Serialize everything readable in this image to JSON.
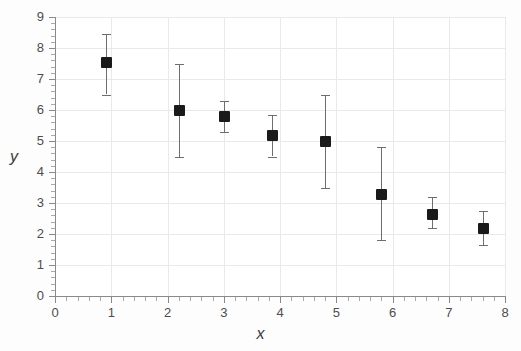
{
  "chart_data": {
    "type": "scatter",
    "title": "",
    "xlabel": "x",
    "ylabel": "y",
    "xlim": [
      0,
      8
    ],
    "ylim": [
      0,
      9
    ],
    "grid": true,
    "legend": null,
    "x_ticks": [
      "0",
      "1",
      "2",
      "3",
      "4",
      "5",
      "6",
      "7",
      "8"
    ],
    "x_tick_values": [
      0,
      1,
      2,
      3,
      4,
      5,
      6,
      7,
      8
    ],
    "y_ticks": [
      "0",
      "1",
      "2",
      "3",
      "4",
      "5",
      "6",
      "7",
      "8",
      "9"
    ],
    "y_tick_values": [
      0,
      1,
      2,
      3,
      4,
      5,
      6,
      7,
      8,
      9
    ],
    "minor_ticks": true,
    "marker_style": "filled-square",
    "marker_color": "#1a1a1a",
    "errorbar_color": "#6e6e6e",
    "gridline_color": "#e9e9e9",
    "axis_color": "#8a8a8a",
    "points": [
      {
        "x": 0.9,
        "y": 7.55,
        "yerr_low": 6.5,
        "yerr_high": 8.45
      },
      {
        "x": 2.2,
        "y": 6.0,
        "yerr_low": 4.5,
        "yerr_high": 7.5
      },
      {
        "x": 3.0,
        "y": 5.8,
        "yerr_low": 5.3,
        "yerr_high": 6.3
      },
      {
        "x": 3.85,
        "y": 5.2,
        "yerr_low": 4.5,
        "yerr_high": 5.85
      },
      {
        "x": 4.8,
        "y": 5.0,
        "yerr_low": 3.5,
        "yerr_high": 6.5
      },
      {
        "x": 5.8,
        "y": 3.3,
        "yerr_low": 1.8,
        "yerr_high": 4.8
      },
      {
        "x": 6.7,
        "y": 2.65,
        "yerr_low": 2.2,
        "yerr_high": 3.2
      },
      {
        "x": 7.6,
        "y": 2.2,
        "yerr_low": 1.65,
        "yerr_high": 2.75
      }
    ],
    "series": [
      {
        "name": "measurements",
        "x": [
          0.9,
          2.2,
          3.0,
          3.85,
          4.8,
          5.8,
          6.7,
          7.6
        ],
        "values": [
          7.55,
          6.0,
          5.8,
          5.2,
          5.0,
          3.3,
          2.65,
          2.2
        ],
        "yerr_low": [
          1.05,
          1.5,
          0.5,
          0.7,
          1.5,
          1.5,
          0.45,
          0.55
        ],
        "yerr_high": [
          0.9,
          1.5,
          0.5,
          0.65,
          1.5,
          1.5,
          0.55,
          0.55
        ]
      }
    ]
  }
}
